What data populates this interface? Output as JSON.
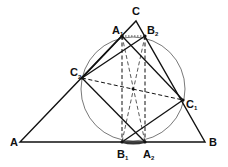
{
  "diagram": {
    "title": "",
    "points": {
      "A": {
        "label": "A",
        "sub": "",
        "x": 20,
        "y": 142
      },
      "B": {
        "label": "B",
        "sub": "",
        "x": 205,
        "y": 142
      },
      "C": {
        "label": "C",
        "sub": "",
        "x": 136,
        "y": 21
      },
      "A1": {
        "label": "A",
        "sub": "1",
        "x": 122,
        "y": 36
      },
      "B2": {
        "label": "B",
        "sub": "2",
        "x": 145,
        "y": 36
      },
      "C2": {
        "label": "C",
        "sub": "2",
        "x": 82,
        "y": 78
      },
      "C1": {
        "label": "C",
        "sub": "1",
        "x": 183,
        "y": 100
      },
      "B1": {
        "label": "B",
        "sub": "1",
        "x": 122,
        "y": 142
      },
      "A2": {
        "label": "A",
        "sub": "2",
        "x": 145,
        "y": 142
      },
      "O": {
        "label": "",
        "sub": "",
        "x": 133,
        "y": 89
      }
    },
    "circle": {
      "cx": 133,
      "cy": 89,
      "r": 52
    },
    "colors": {
      "stroke": "#111111",
      "circle": "#555555"
    }
  }
}
